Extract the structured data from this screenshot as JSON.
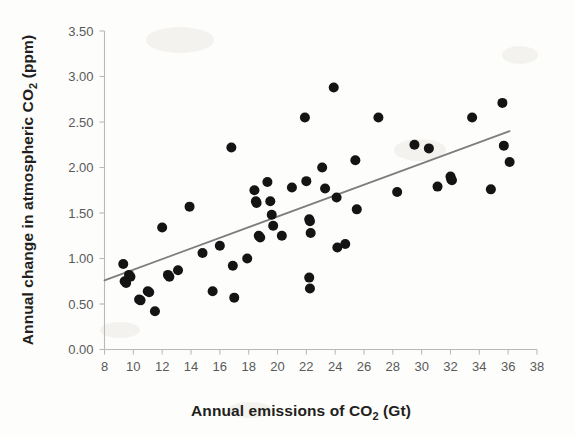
{
  "figure": {
    "name": "scatter-plot-co2",
    "background_color": "#fdfdfc"
  },
  "chart_data": {
    "type": "scatter",
    "title": "",
    "xlabel": "Annual emissions of CO2 (Gt)",
    "xlabel_parts": {
      "pre": "Annual emissions of CO",
      "sub": "2",
      "post": " (Gt)"
    },
    "ylabel": "Annual change in atmospheric CO2 (ppm)",
    "ylabel_parts": {
      "pre": "Annual change in atmospheric CO",
      "sub": "2",
      "post": " (ppm)"
    },
    "xlim": [
      8,
      38
    ],
    "ylim": [
      0.0,
      3.5
    ],
    "xticks": [
      8,
      10,
      12,
      14,
      16,
      18,
      20,
      22,
      24,
      26,
      28,
      30,
      32,
      34,
      36,
      38
    ],
    "xtick_labels": [
      "8",
      "10",
      "12",
      "14",
      "16",
      "18",
      "20",
      "22",
      "24",
      "26",
      "28",
      "30",
      "32",
      "34",
      "36",
      "38"
    ],
    "yticks": [
      0.0,
      0.5,
      1.0,
      1.5,
      2.0,
      2.5,
      3.0,
      3.5
    ],
    "ytick_labels": [
      "0.00",
      "0.50",
      "1.00",
      "1.50",
      "2.00",
      "2.50",
      "3.00",
      "3.50"
    ],
    "grid": false,
    "legend": null,
    "marker_color": "#141414",
    "marker_size": 5.0,
    "trendline": {
      "name": "linear-fit",
      "color": "#7d7d7d",
      "x_start": 8.0,
      "y_start": 0.76,
      "x_end": 36.1,
      "y_end": 2.4,
      "slope": 0.0584,
      "intercept": 0.29
    },
    "points": [
      [
        9.3,
        0.94
      ],
      [
        9.4,
        0.75
      ],
      [
        9.5,
        0.73
      ],
      [
        9.7,
        0.82
      ],
      [
        9.8,
        0.8
      ],
      [
        10.4,
        0.55
      ],
      [
        10.5,
        0.54
      ],
      [
        11.0,
        0.64
      ],
      [
        11.1,
        0.63
      ],
      [
        11.5,
        0.42
      ],
      [
        12.0,
        1.34
      ],
      [
        12.4,
        0.82
      ],
      [
        12.5,
        0.8
      ],
      [
        13.1,
        0.87
      ],
      [
        13.9,
        1.57
      ],
      [
        14.8,
        1.06
      ],
      [
        15.5,
        0.64
      ],
      [
        16.0,
        1.14
      ],
      [
        16.8,
        2.22
      ],
      [
        16.9,
        0.92
      ],
      [
        17.0,
        0.57
      ],
      [
        17.9,
        1.0
      ],
      [
        18.4,
        1.75
      ],
      [
        18.5,
        1.63
      ],
      [
        18.55,
        1.61
      ],
      [
        18.7,
        1.25
      ],
      [
        18.8,
        1.23
      ],
      [
        19.3,
        1.84
      ],
      [
        19.5,
        1.63
      ],
      [
        19.6,
        1.48
      ],
      [
        19.7,
        1.36
      ],
      [
        20.3,
        1.25
      ],
      [
        21.0,
        1.78
      ],
      [
        21.9,
        2.55
      ],
      [
        22.0,
        1.85
      ],
      [
        22.2,
        1.43
      ],
      [
        22.25,
        1.41
      ],
      [
        22.3,
        1.28
      ],
      [
        22.2,
        0.79
      ],
      [
        22.25,
        0.67
      ],
      [
        23.1,
        2.0
      ],
      [
        23.3,
        1.77
      ],
      [
        23.9,
        2.88
      ],
      [
        24.1,
        1.67
      ],
      [
        24.15,
        1.12
      ],
      [
        24.7,
        1.16
      ],
      [
        25.4,
        2.08
      ],
      [
        25.5,
        1.54
      ],
      [
        27.0,
        2.55
      ],
      [
        28.3,
        1.73
      ],
      [
        29.5,
        2.25
      ],
      [
        30.5,
        2.21
      ],
      [
        31.1,
        1.79
      ],
      [
        32.0,
        1.9
      ],
      [
        32.05,
        1.87
      ],
      [
        32.1,
        1.86
      ],
      [
        33.5,
        2.55
      ],
      [
        34.8,
        1.76
      ],
      [
        35.6,
        2.71
      ],
      [
        35.7,
        2.24
      ],
      [
        36.1,
        2.06
      ]
    ],
    "point_count": 61
  }
}
